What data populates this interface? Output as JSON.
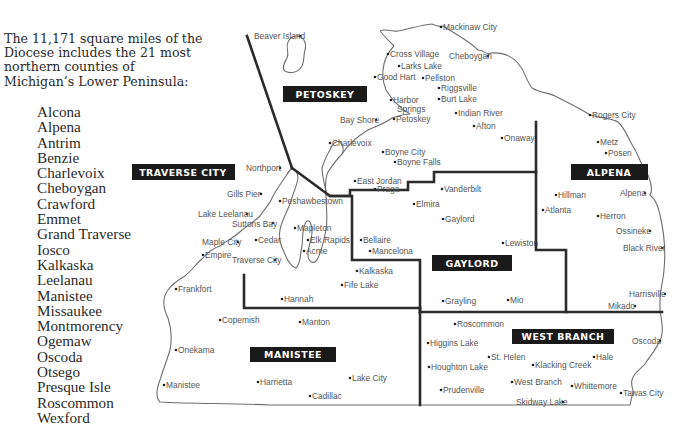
{
  "intro": "The 11,171 square miles of the Diocese includes the 21 most northern counties of Michigan’s Lower Peninsula:",
  "counties": [
    "Alcona",
    "Alpena",
    "Antrim",
    "Benzie",
    "Charlevoix",
    "Cheboygan",
    "Crawford",
    "Emmet",
    "Grand Traverse",
    "Iosco",
    "Kalkaska",
    "Leelanau",
    "Manistee",
    "Missaukee",
    "Montmorency",
    "Ogemaw",
    "Oscoda",
    "Otsego",
    "Presque Isle",
    "Roscommon",
    "Wexford"
  ],
  "colors": {
    "region_label_bg": "#1a1a1a",
    "region_label_text": "#ffffff",
    "border": "#2b2b2b",
    "coast": "#6e6e6e",
    "town_text": "#555555"
  },
  "regions": [
    {
      "name": "PETOSKEY"
    },
    {
      "name": "TRAVERSE CITY"
    },
    {
      "name": "ALPENA"
    },
    {
      "name": "GAYLORD"
    },
    {
      "name": "MANISTEE"
    },
    {
      "name": "WEST BRANCH"
    }
  ],
  "towns": [
    "Beaver Island",
    "Mackinaw City",
    "Cross Village",
    "Cheboygan",
    "Larks Lake",
    "Good Hart",
    "Pellston",
    "Riggsville",
    "Harbor Springs",
    "Burt Lake",
    "Indian River",
    "Bay Shore",
    "Petoskey",
    "Afton",
    "Onaway",
    "Charlevoix",
    "Boyne City",
    "Boyne Falls",
    "East Jordan",
    "Praga",
    "Vanderbilt",
    "Elmira",
    "Gaylord",
    "Rogers City",
    "Metz",
    "Posen",
    "Hillman",
    "Atlanta",
    "Alpena",
    "Herron",
    "Ossineke",
    "Black River",
    "Harrisville",
    "Mikado",
    "Northport",
    "Gills Pier",
    "Peshawbestown",
    "Lake Leelanau",
    "Suttons Bay",
    "Mapleton",
    "Maple City",
    "Cedar",
    "Elk Rapids",
    "Empire",
    "Traverse City",
    "Acme",
    "Bellaire",
    "Mancelona",
    "Lewiston",
    "Kalkaska",
    "Fife Lake",
    "Frankfort",
    "Hannah",
    "Grayling",
    "Mio",
    "Copemish",
    "Manton",
    "Roscommon",
    "Onekama",
    "Higgins Lake",
    "St. Helen",
    "Hale",
    "Oscoda",
    "Houghton Lake",
    "Klacking Creek",
    "Manistee",
    "Harrietta",
    "Lake City",
    "West Branch",
    "Whittemore",
    "Prudenville",
    "Tawas City",
    "Cadillac",
    "Skidway Lake"
  ]
}
